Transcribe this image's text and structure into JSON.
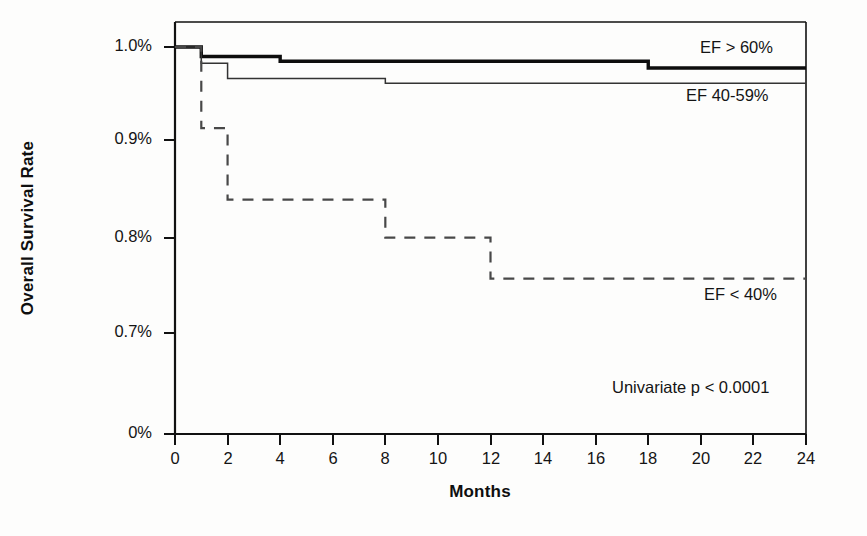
{
  "chart_data": {
    "type": "line",
    "subtype": "kaplan-meier-step",
    "title": "",
    "xlabel": "Months",
    "ylabel": "Overall Survival Rate",
    "xlim": [
      0,
      24
    ],
    "xticks": [
      0,
      2,
      4,
      6,
      8,
      10,
      12,
      14,
      16,
      18,
      20,
      22,
      24
    ],
    "xtick_labels": [
      "0",
      "2",
      "4",
      "6",
      "8",
      "10",
      "12",
      "14",
      "16",
      "18",
      "20",
      "22",
      "24"
    ],
    "yticks": [
      1.0,
      0.9,
      0.8,
      0.7,
      0.0
    ],
    "ytick_labels": [
      "1.0%",
      "0.9%",
      "0.8%",
      "0.7%",
      "0%"
    ],
    "y_axis_broken": true,
    "grid": false,
    "legend_position": "inline-right",
    "series": [
      {
        "name": "EF > 60%",
        "style": "solid-thick",
        "label_x": 19.7,
        "label_y": 0.995,
        "steps": [
          {
            "x": 0,
            "y": 1.0
          },
          {
            "x": 1,
            "y": 0.99
          },
          {
            "x": 4,
            "y": 0.985
          },
          {
            "x": 18,
            "y": 0.978
          },
          {
            "x": 24,
            "y": 0.978
          }
        ]
      },
      {
        "name": "EF 40-59%",
        "style": "solid-thin",
        "label_x": 19.4,
        "label_y": 0.952,
        "steps": [
          {
            "x": 0,
            "y": 1.0
          },
          {
            "x": 1,
            "y": 0.983
          },
          {
            "x": 2,
            "y": 0.967
          },
          {
            "x": 8,
            "y": 0.962
          },
          {
            "x": 24,
            "y": 0.962
          }
        ]
      },
      {
        "name": "EF < 40%",
        "style": "dashed",
        "label_x": 19.9,
        "label_y": 0.733,
        "steps": [
          {
            "x": 0,
            "y": 1.0
          },
          {
            "x": 1,
            "y": 0.915
          },
          {
            "x": 2,
            "y": 0.84
          },
          {
            "x": 8,
            "y": 0.8
          },
          {
            "x": 12,
            "y": 0.757
          },
          {
            "x": 24,
            "y": 0.757
          }
        ]
      }
    ],
    "annotations": [
      {
        "name": "pvalue",
        "text": "Univariate p < 0.0001",
        "x": 16.6,
        "y": 0.665
      }
    ],
    "colors": {
      "axis": "#111111",
      "series_ef_gt60": "#0d0d0d",
      "series_ef_40_59": "#3a3a3a",
      "series_ef_lt40": "#4a4a4a",
      "background": "#fdfdfc"
    }
  },
  "labels": {
    "y_axis_title": "Overall Survival Rate",
    "x_axis_title": "Months"
  }
}
